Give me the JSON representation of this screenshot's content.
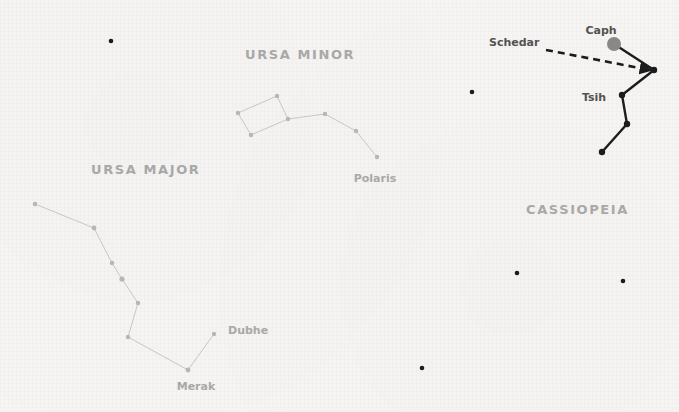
{
  "canvas": {
    "width": 679,
    "height": 412,
    "background_color": "#f6f5f4"
  },
  "colors": {
    "faint_line": "#c9c7c5",
    "faint_star": "#b8b6b4",
    "faint_text": "#a9a8a6",
    "bright_line": "#1c1c1c",
    "bright_star": "#1c1c1c",
    "bright_text": "#55514f",
    "caph_marker": "#8a8886",
    "arrow": "#1c1c1c",
    "background_star": "#1c1c1c"
  },
  "constellations": [
    {
      "id": "ursa-minor",
      "name": "URSA MINOR",
      "name_x": 245,
      "name_y": 59,
      "name_size": 13,
      "style": "faint",
      "stars": [
        {
          "name": "bowl-top",
          "x": 277,
          "y": 96,
          "r": 2.2
        },
        {
          "name": "bowl-left",
          "x": 238,
          "y": 113,
          "r": 2.2
        },
        {
          "name": "bowl-bottom",
          "x": 251,
          "y": 135,
          "r": 2.2
        },
        {
          "name": "bowl-right",
          "x": 288,
          "y": 119,
          "r": 2.2
        },
        {
          "name": "handle-1",
          "x": 325,
          "y": 114,
          "r": 2.2
        },
        {
          "name": "handle-2",
          "x": 356,
          "y": 131,
          "r": 2.2
        },
        {
          "name": "polaris",
          "x": 377,
          "y": 157,
          "r": 2.2
        }
      ],
      "lines": [
        [
          277,
          96,
          238,
          113
        ],
        [
          238,
          113,
          251,
          135
        ],
        [
          251,
          135,
          288,
          119
        ],
        [
          288,
          119,
          277,
          96
        ],
        [
          288,
          119,
          325,
          114
        ],
        [
          325,
          114,
          356,
          131
        ],
        [
          356,
          131,
          377,
          157
        ]
      ],
      "labels": [
        {
          "text": "Polaris",
          "x": 375,
          "y": 182,
          "size": 11,
          "style": "faint",
          "anchor": "middle"
        }
      ]
    },
    {
      "id": "ursa-major",
      "name": "URSA MAJOR",
      "name_x": 91,
      "name_y": 174,
      "name_size": 13,
      "style": "faint",
      "stars": [
        {
          "name": "alkaid",
          "x": 35,
          "y": 204,
          "r": 2.2
        },
        {
          "name": "mizar",
          "x": 94,
          "y": 228,
          "r": 2.4
        },
        {
          "name": "alioth",
          "x": 112,
          "y": 263,
          "r": 2.2
        },
        {
          "name": "megrez",
          "x": 122,
          "y": 279,
          "r": 2.6
        },
        {
          "name": "phecda",
          "x": 138,
          "y": 303,
          "r": 2.2
        },
        {
          "name": "bowl-sw",
          "x": 128,
          "y": 337,
          "r": 2.2
        },
        {
          "name": "merak",
          "x": 188,
          "y": 370,
          "r": 2.4
        },
        {
          "name": "dubhe",
          "x": 214,
          "y": 334,
          "r": 2.2
        }
      ],
      "lines": [
        [
          35,
          204,
          94,
          228
        ],
        [
          94,
          228,
          112,
          263
        ],
        [
          112,
          263,
          122,
          279
        ],
        [
          122,
          279,
          138,
          303
        ],
        [
          138,
          303,
          128,
          337
        ],
        [
          128,
          337,
          188,
          370
        ],
        [
          188,
          370,
          214,
          334
        ]
      ],
      "labels": [
        {
          "text": "Dubhe",
          "x": 228,
          "y": 334,
          "size": 11,
          "style": "faint",
          "anchor": "start"
        },
        {
          "text": "Merak",
          "x": 196,
          "y": 390,
          "size": 11,
          "style": "faint",
          "anchor": "middle"
        }
      ]
    },
    {
      "id": "cassiopeia",
      "name": "CASSIOPEIA",
      "name_x": 526,
      "name_y": 214,
      "name_size": 13,
      "style": "bright",
      "stars": [
        {
          "name": "caph",
          "x": 614,
          "y": 44,
          "r": 7.0,
          "fill": "#8a8886"
        },
        {
          "name": "schedar",
          "x": 654,
          "y": 70,
          "r": 3.2
        },
        {
          "name": "tsih",
          "x": 622,
          "y": 95,
          "r": 3.2
        },
        {
          "name": "ruchbah",
          "x": 627,
          "y": 124,
          "r": 3.2
        },
        {
          "name": "segin",
          "x": 602,
          "y": 152,
          "r": 3.2
        }
      ],
      "lines": [
        [
          614,
          44,
          654,
          70
        ],
        [
          654,
          70,
          622,
          95
        ],
        [
          622,
          95,
          627,
          124
        ],
        [
          627,
          124,
          602,
          152
        ]
      ],
      "labels": [
        {
          "text": "Caph",
          "x": 601,
          "y": 34,
          "size": 11,
          "style": "bright",
          "anchor": "middle"
        },
        {
          "text": "Schedar",
          "x": 489,
          "y": 46,
          "size": 11,
          "style": "bright",
          "anchor": "start"
        },
        {
          "text": "Tsih",
          "x": 582,
          "y": 101,
          "size": 11,
          "style": "bright",
          "anchor": "start"
        }
      ]
    }
  ],
  "annotations": [
    {
      "id": "schedar-pointer",
      "type": "dashed-arrow",
      "x1": 546,
      "y1": 50,
      "x2": 650,
      "y2": 70,
      "dash": "7 5",
      "stroke_width": 2.6
    }
  ],
  "background_stars": [
    {
      "x": 111,
      "y": 41,
      "r": 2.3
    },
    {
      "x": 472,
      "y": 92,
      "r": 2.3
    },
    {
      "x": 517,
      "y": 273,
      "r": 2.3
    },
    {
      "x": 623,
      "y": 281,
      "r": 2.3
    },
    {
      "x": 422,
      "y": 368,
      "r": 2.3
    }
  ]
}
